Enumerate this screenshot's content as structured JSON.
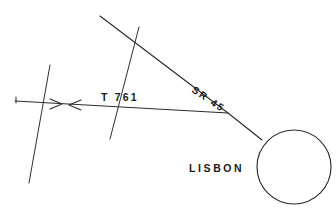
{
  "figure": {
    "type": "road-map-sketch",
    "background_color": "#ffffff",
    "ink_color": "#2b2b2b"
  },
  "labels": {
    "route_t761": "T 761",
    "route_sr45": "SR 45",
    "city_lisbon": "LISBON"
  },
  "features": {
    "city_marker_name": "lisbon-circle",
    "direction_markers": "opposing-arrowheads",
    "west_terminus_tick": "end-tick"
  }
}
